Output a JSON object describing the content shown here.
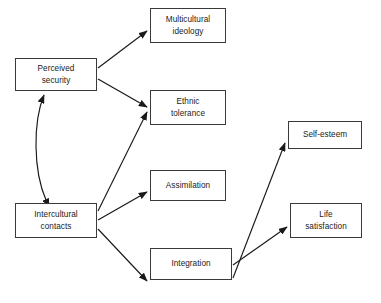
{
  "diagram": {
    "background_color": "#ffffff",
    "box_border_color": "#3a3a3a",
    "box_fill_color": "#ffffff",
    "arrow_color": "#1a1a1a",
    "nodes": [
      {
        "id": "perceived-security",
        "label": "Perceived\nsecurity",
        "x": 15,
        "y": 58,
        "width": 82,
        "height": 33
      },
      {
        "id": "intercultural-contacts",
        "label": "Intercultural\ncontacts",
        "x": 15,
        "y": 203,
        "width": 82,
        "height": 35
      },
      {
        "id": "multicultural-ideology",
        "label": "Multicultural\nideology",
        "x": 150,
        "y": 8,
        "width": 76,
        "height": 35
      },
      {
        "id": "ethnic-tolerance",
        "label": "Ethnic\ntolerance",
        "x": 150,
        "y": 90,
        "width": 76,
        "height": 35
      },
      {
        "id": "assimilation",
        "label": "Assimilation",
        "x": 150,
        "y": 170,
        "width": 76,
        "height": 31
      },
      {
        "id": "integration",
        "label": "Integration",
        "x": 150,
        "y": 248,
        "width": 82,
        "height": 32
      },
      {
        "id": "self-esteem",
        "label": "Self-esteem",
        "x": 288,
        "y": 121,
        "width": 74,
        "height": 28
      },
      {
        "id": "life-satisfaction",
        "label": "Life\nsatisfaction",
        "x": 290,
        "y": 203,
        "width": 72,
        "height": 35
      }
    ],
    "edges": [
      {
        "id": "perceived-security-to-multicultural-ideology",
        "from": "perceived-security",
        "to": "multicultural-ideology",
        "type": "directed",
        "path": "M 98,68 L 147,31"
      },
      {
        "id": "perceived-security-to-ethnic-tolerance",
        "from": "perceived-security",
        "to": "ethnic-tolerance",
        "type": "directed",
        "path": "M 98,79 L 147,107"
      },
      {
        "id": "intercultural-contacts-to-ethnic-tolerance",
        "from": "intercultural-contacts",
        "to": "ethnic-tolerance",
        "type": "directed",
        "path": "M 98,211 L 147,112"
      },
      {
        "id": "intercultural-contacts-to-assimilation",
        "from": "intercultural-contacts",
        "to": "assimilation",
        "type": "directed",
        "path": "M 98,220 L 147,192"
      },
      {
        "id": "intercultural-contacts-to-integration",
        "from": "intercultural-contacts",
        "to": "integration",
        "type": "directed",
        "path": "M 98,229 L 147,281"
      },
      {
        "id": "integration-to-self-esteem",
        "from": "integration",
        "to": "self-esteem",
        "type": "directed",
        "path": "M 233,278 L 285,143"
      },
      {
        "id": "integration-to-life-satisfaction",
        "from": "integration",
        "to": "life-satisfaction",
        "type": "directed",
        "path": "M 233,265 L 287,227"
      },
      {
        "id": "perceived-security-intercultural-contacts-correlation",
        "from": "intercultural-contacts",
        "to": "perceived-security",
        "type": "bidirectional-curved",
        "path": "M 46,200 C 33,170 33,122 44,95"
      }
    ]
  }
}
